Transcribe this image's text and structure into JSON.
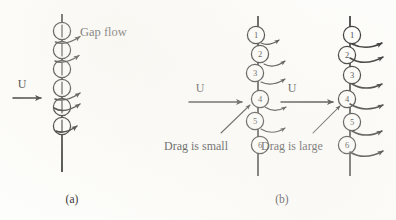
{
  "figure": {
    "background_color": "#fdfdfb",
    "ink_color": "#1b1b1b",
    "labels": {
      "gap_flow": "Gap flow",
      "velocity_a": "U",
      "velocity_b_left": "U",
      "velocity_b_right": "U",
      "drag_small": "Drag is small",
      "drag_large": "Drag is large",
      "caption_a": "(a)",
      "caption_b": "(b)"
    },
    "panels": [
      {
        "id": "panel-a",
        "caption": "(a)",
        "chain": {
          "id": "chain-a",
          "axis_x": 62,
          "circle_count": 6,
          "circle_radius": 8.6,
          "circle_spacing": 19,
          "first_center_y": 31,
          "numbered": false,
          "tick_marks": true,
          "line_top_y": 14,
          "line_bottom_y": 172
        },
        "inflow_label": "U",
        "inflow_y": 95,
        "annotation": "Gap flow",
        "gap_arrow_count": 5
      },
      {
        "id": "panel-b",
        "caption": "(b)",
        "chains": [
          {
            "id": "chain-b-left",
            "axis_x": 258,
            "circle_count": 6,
            "circle_numbers": [
              "1",
              "2",
              "3",
              "4",
              "5",
              "6"
            ],
            "circle_radius": 8.6,
            "circle_spacing": 19,
            "first_center_y": 35,
            "line_top_y": 16,
            "line_bottom_y": 176,
            "inflow_label": "U",
            "inflow_y": 99,
            "annotation": "Drag is small",
            "annotation_target_circle": "4",
            "gap_arrow_count": 5,
            "gap_arrow_style": "short"
          },
          {
            "id": "chain-b-right",
            "axis_x": 350,
            "circle_count": 6,
            "circle_numbers": [
              "1",
              "2",
              "3",
              "4",
              "5",
              "6"
            ],
            "circle_radius": 8.6,
            "circle_spacing": 19,
            "first_center_y": 35,
            "line_top_y": 16,
            "line_bottom_y": 176,
            "inflow_label": "U",
            "inflow_y": 99,
            "annotation": "Drag is large",
            "annotation_target_circle": "4",
            "gap_arrow_count": 6,
            "gap_arrow_style": "long-curved"
          }
        ]
      }
    ]
  }
}
